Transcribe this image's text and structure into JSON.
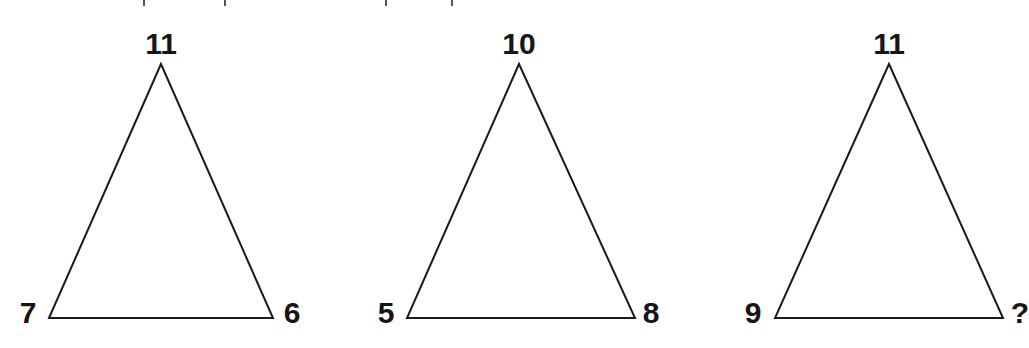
{
  "puzzle": {
    "type": "number-triangle-sequence",
    "triangles": [
      {
        "top": "11",
        "left": "7",
        "right": "6",
        "apex": [
          161,
          64
        ],
        "base_left": [
          49,
          318
        ],
        "base_right": [
          273,
          318
        ],
        "label_pos": {
          "top": [
            161,
            44
          ],
          "left": [
            28,
            313
          ],
          "right": [
            292,
            313
          ]
        }
      },
      {
        "top": "10",
        "left": "5",
        "right": "8",
        "apex": [
          519,
          64
        ],
        "base_left": [
          407,
          318
        ],
        "base_right": [
          635,
          318
        ],
        "label_pos": {
          "top": [
            519,
            44
          ],
          "left": [
            386,
            313
          ],
          "right": [
            651,
            313
          ]
        }
      },
      {
        "top": "11",
        "left": "9",
        "right": "?",
        "apex": [
          889,
          64
        ],
        "base_left": [
          775,
          318
        ],
        "base_right": [
          1003,
          318
        ],
        "label_pos": {
          "top": [
            889,
            44
          ],
          "left": [
            753,
            313
          ],
          "right": [
            1020,
            313
          ]
        }
      }
    ],
    "stroke_color": "#1a1a1a",
    "text_color": "#151515",
    "background": "#ffffff"
  },
  "cutoff_marks_x": [
    143,
    224,
    385,
    451
  ]
}
